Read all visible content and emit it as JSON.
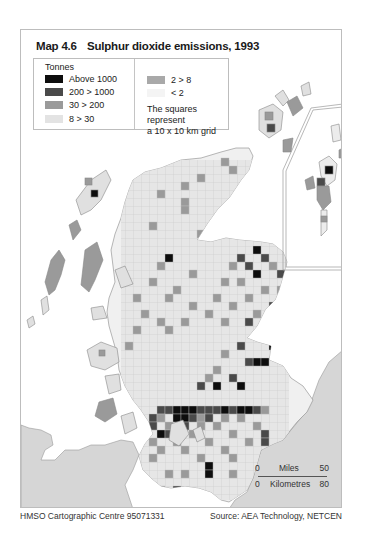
{
  "map": {
    "number": "Map 4.6",
    "title": "Sulphur dioxide emissions, 1993"
  },
  "legend": {
    "unit": "Tonnes",
    "items": [
      {
        "label": "Above 1000",
        "color": "#0d0d0d"
      },
      {
        "label": "200 > 1000",
        "color": "#4a4a4a"
      },
      {
        "label": "30 > 200",
        "color": "#9a9a9a"
      },
      {
        "label": "8 > 30",
        "color": "#e3e3e3"
      },
      {
        "label": "2 > 8",
        "color": "#a9a9a9"
      },
      {
        "label": "< 2",
        "color": "#f4f4f4"
      }
    ],
    "note_line1": "The squares represent",
    "note_line2": "a 10 x 10 km grid"
  },
  "scale": {
    "miles_label": "Miles",
    "miles_start": "0",
    "miles_end": "50",
    "km_label": "Kilometres",
    "km_start": "0",
    "km_end": "80"
  },
  "footer": {
    "left": "HMSO Cartographic Centre 95071331",
    "right": "Source: AEA Technology, NETCEN"
  },
  "colors": {
    "land_other": "#d6d6d6",
    "grid_line": "#c8c8c8",
    "frame": "#bdbdbd"
  }
}
